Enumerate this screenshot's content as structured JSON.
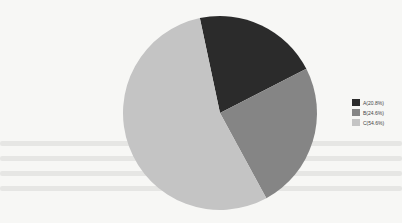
{
  "chart_data": {
    "type": "pie",
    "title": "",
    "categories": [
      "A",
      "B",
      "C"
    ],
    "values": [
      20.8,
      24.6,
      54.6
    ],
    "units": "%",
    "colors": [
      "#2b2b2b",
      "#858585",
      "#c4c4c4"
    ],
    "start_angle_deg": -12,
    "direction": "clockwise",
    "legend": {
      "position": "right",
      "entries": [
        "A(20.8%)",
        "B(24.6%)",
        "C(54.6%)"
      ]
    }
  },
  "legend": {
    "items": [
      {
        "label": "A(20.8%)",
        "color": "#2b2b2b"
      },
      {
        "label": "B(24.6%)",
        "color": "#858585"
      },
      {
        "label": "C(54.6%)",
        "color": "#c4c4c4"
      }
    ]
  }
}
